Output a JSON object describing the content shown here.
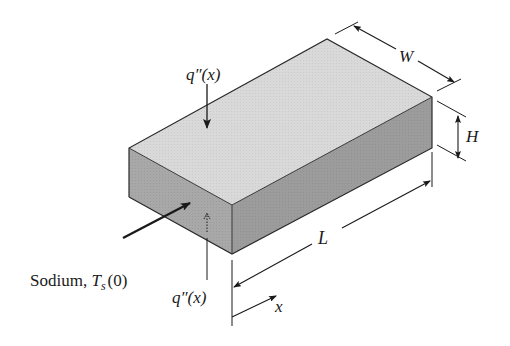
{
  "figure": {
    "labels": {
      "q_top": "q″(x)",
      "q_bottom": "q″(x)",
      "width": "W",
      "height": "H",
      "length": "L",
      "x_axis": "x",
      "inlet_prefix": "Sodium, ",
      "inlet_T": "T",
      "inlet_sub": "s",
      "inlet_suffix": "(0)"
    },
    "colors": {
      "top_face": "#d9d9d9",
      "front_face": "#a6a6a6",
      "side_face": "#9a9a9a",
      "lines": "#1a1a1a"
    }
  }
}
